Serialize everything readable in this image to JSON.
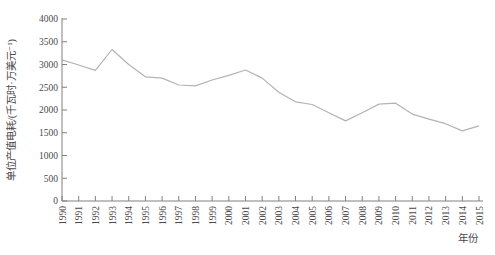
{
  "figure": {
    "background": "#ffffff",
    "line_color": "#b3b3b3",
    "axis_color": "#808080",
    "label_color": "#4a4a4a"
  },
  "chart_data": {
    "type": "line",
    "title": "",
    "xlabel": "年份",
    "ylabel": "单位产值电耗/(千瓦时·万美元⁻¹)",
    "x": [
      1990,
      1991,
      1992,
      1993,
      1994,
      1995,
      1996,
      1997,
      1998,
      1999,
      2000,
      2001,
      2002,
      2003,
      2004,
      2005,
      2006,
      2007,
      2008,
      2009,
      2010,
      2011,
      2012,
      2013,
      2014,
      2015
    ],
    "values": [
      3100,
      2990,
      2870,
      3330,
      3000,
      2730,
      2700,
      2550,
      2530,
      2660,
      2760,
      2880,
      2700,
      2390,
      2180,
      2120,
      1940,
      1760,
      1940,
      2130,
      2150,
      1910,
      1800,
      1700,
      1540,
      1650
    ],
    "ylim": [
      0,
      4000
    ],
    "ytick_step": 500,
    "xtick_every": 1,
    "grid": false,
    "legend": "none",
    "series_name": "单位产值电耗"
  }
}
